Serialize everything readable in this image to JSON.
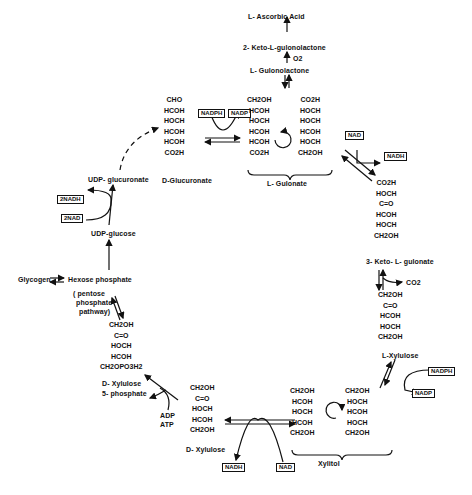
{
  "compounds": {
    "ascorbic_acid": "L- Ascorbic Acid",
    "keto_gulonolactone": "2- Keto-L-gulonolactone",
    "o2": "O2",
    "gulonolactone": "L- Gulonolactone",
    "glucuronate": "D-Glucuronate",
    "gulonate": "L- Gulonate",
    "keto_gulonate": "3- Keto- L- gulonate",
    "co2": "CO2",
    "l_xylulose": "L-Xylulose",
    "xylitol": "Xylitol",
    "d_xylulose": "D- Xylulose",
    "d_xylulose_5p_line1": "D- Xylulose",
    "d_xylulose_5p_line2": "5- phosphate",
    "udp_glucuronate": "UDP- glucuronate",
    "udp_glucose": "UDP-glucose",
    "glycogen": "Glycogen",
    "hexose_phosphate": "Hexose  phosphate",
    "pentose_line1": "( pentose",
    "pentose_line2": "phosphate",
    "pentose_line3": "pathway)",
    "adp": "ADP",
    "atp": "ATP"
  },
  "cofactors": {
    "nadph_top": "NADPH",
    "nadp_top": "NADP",
    "nad_right": "NAD",
    "nadh_right": "NADH",
    "nadph_lower": "NADPH",
    "nadp_lower": "NADP",
    "nadh_bottom": "NADH",
    "nad_bottom": "NAD",
    "two_nadh": "2NADH",
    "two_nad": "2NAD"
  },
  "structures": {
    "glucuronate": "CHO\nHCOH\nHOCH\nHCOH\nHCOH\nCO2H",
    "gulonate_a": "CH2OH\nHCOH\nHOCH\nHCOH\nHCOH\nCO2H",
    "gulonate_b": "CO2H\nHOCH\nHOCH\nHCOH\nHOCH\nCH2OH",
    "keto_gulonate": "CO2H\nHOCH\nC=O\nHCOH\nHOCH\nCH2OH",
    "l_xylulose": "CH2OH\nC=O\nHCOH\nHOCH\nCH2OH",
    "xylitol_a": "CH2OH\nHCOH\nHOCH\nHCOH\nCH2OH",
    "xylitol_b": "CH2OH\nHOCH\nHCOH\nHOCH\nCH2OH",
    "d_xylulose": "CH2OH\nC=O\nHOCH\nHCOH\nCH2OH",
    "d_xylulose_5p": "CH2OH\nC=O\nHOCH\nHCOH\nCH2OPO3H2"
  }
}
